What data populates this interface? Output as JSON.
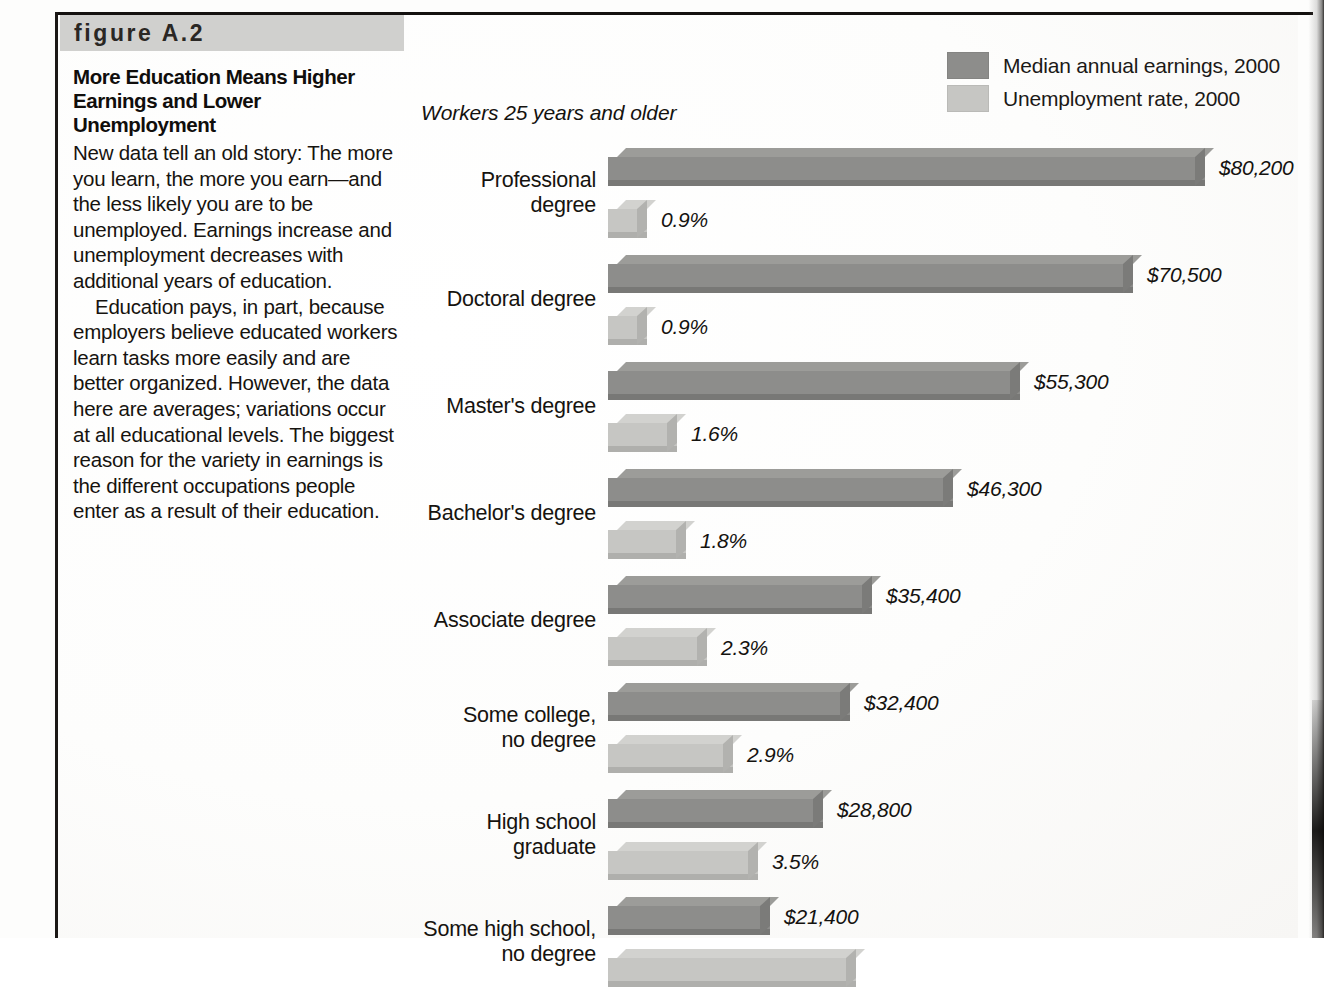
{
  "figure": {
    "label": "figure A.2",
    "title_line1": "More Education Means Higher",
    "title_line2": "Earnings and Lower Unemployment",
    "paragraph1": "New data tell an old story: The more you learn, the more you earn—and the less likely you are to be unemployed. Earnings increase and unemployment decreases with additional years of education.",
    "paragraph2": "Education pays, in part, because employers believe educated workers learn tasks more easily and are better organized. However, the data here are averages; variations occur at all educational levels. The biggest reason for the variety in earnings is the different occupations people enter as a result of their education."
  },
  "colors": {
    "earnings_bar": "#8d8d8b",
    "earnings_bar_top": "#9c9c99",
    "earnings_bar_side": "#7b7b79",
    "earnings_bar_shade": "#787876",
    "unemployment_bar": "#c6c6c3",
    "unemployment_bar_top": "#d2d2cf",
    "unemployment_bar_side": "#b2b2af",
    "unemployment_bar_shade": "#afafac",
    "band": "#d0d0ce",
    "rule": "#14110f",
    "text": "#16130f"
  },
  "chart_data": {
    "type": "bar",
    "orientation": "horizontal",
    "title": "More Education Means Higher Earnings and Lower Unemployment",
    "subtitle": "Workers 25 years and older",
    "xlabel": "",
    "ylabel": "",
    "grid": false,
    "legend_position": "top-right",
    "legend": [
      {
        "name": "Median annual earnings, 2000",
        "color": "#8d8d8b"
      },
      {
        "name": "Unemployment rate, 2000",
        "color": "#c6c6c3"
      }
    ],
    "categories": [
      "Professional degree",
      "Doctoral degree",
      "Master's degree",
      "Bachelor's degree",
      "Associate degree",
      "Some college, no degree",
      "High school graduate",
      "Some high school, no degree"
    ],
    "series": [
      {
        "name": "Median annual earnings, 2000",
        "unit": "USD",
        "values": [
          80200,
          70500,
          55300,
          46300,
          35400,
          32400,
          28800,
          21400
        ],
        "labels": [
          "$80,200",
          "$70,500",
          "$55,300",
          "$46,300",
          "$35,400",
          "$32,400",
          "$28,800",
          "$21,400"
        ]
      },
      {
        "name": "Unemployment rate, 2000",
        "unit": "percent",
        "values": [
          0.9,
          0.9,
          1.6,
          1.8,
          2.3,
          2.9,
          3.5,
          5.75
        ],
        "labels": [
          "0.9%",
          "0.9%",
          "1.6%",
          "1.8%",
          "2.3%",
          "2.9%",
          "3.5%",
          ""
        ]
      }
    ]
  },
  "rows": [
    {
      "label_lines": [
        "Professional",
        "degree"
      ],
      "earn_label": "$80,200",
      "earn_width": 597,
      "unemp_label": "0.9%",
      "unemp_width": 39
    },
    {
      "label_lines": [
        "Doctoral degree"
      ],
      "earn_label": "$70,500",
      "earn_width": 525,
      "unemp_label": "0.9%",
      "unemp_width": 39
    },
    {
      "label_lines": [
        "Master's degree"
      ],
      "earn_label": "$55,300",
      "earn_width": 412,
      "unemp_label": "1.6%",
      "unemp_width": 69
    },
    {
      "label_lines": [
        "Bachelor's degree"
      ],
      "earn_label": "$46,300",
      "earn_width": 345,
      "unemp_label": "1.8%",
      "unemp_width": 78
    },
    {
      "label_lines": [
        "Associate degree"
      ],
      "earn_label": "$35,400",
      "earn_width": 264,
      "unemp_label": "2.3%",
      "unemp_width": 99
    },
    {
      "label_lines": [
        "Some college,",
        "no degree"
      ],
      "earn_label": "$32,400",
      "earn_width": 242,
      "unemp_label": "2.9%",
      "unemp_width": 125
    },
    {
      "label_lines": [
        "High school",
        "graduate"
      ],
      "earn_label": "$28,800",
      "earn_width": 215,
      "unemp_label": "3.5%",
      "unemp_width": 150
    },
    {
      "label_lines": [
        "Some high school,",
        "no degree"
      ],
      "earn_label": "$21,400",
      "earn_width": 162,
      "unemp_label": "",
      "unemp_width": 248
    }
  ]
}
